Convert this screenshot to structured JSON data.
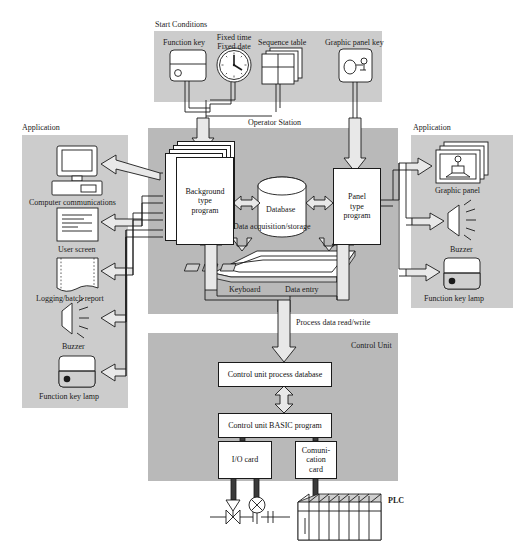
{
  "diagram": {
    "colors": {
      "panel_gray": "#b9b9b9",
      "panel_light_gray": "#cccccc",
      "panel_dark_gray": "#a8a8a8",
      "box_fill": "#ffffff",
      "arrow_fill": "#e8e8e8",
      "line": "#1a1a1a"
    }
  },
  "start_conditions": {
    "panel_label": "Start Conditions",
    "items": [
      {
        "label": "Function key",
        "icon": "function-key-icon"
      },
      {
        "label": "Fixed time\nFixed date",
        "line1": "Fixed time",
        "line2": "Fixed date",
        "icon": "clock-icon"
      },
      {
        "label": "Sequence table",
        "icon": "sequence-table-icon"
      },
      {
        "label": "Graphic panel key",
        "icon": "graphic-panel-key-icon"
      }
    ]
  },
  "operator_station": {
    "panel_label": "Operator Station",
    "blocks": [
      {
        "id": "background-type-program",
        "label": "Background\ntype\nprogram",
        "l1": "Background",
        "l2": "type",
        "l3": "program"
      },
      {
        "id": "database",
        "label": "Database"
      },
      {
        "id": "panel-type-program",
        "label": "Panel\ntype\nprogram",
        "l1": "Panel",
        "l2": "type",
        "l3": "program"
      }
    ],
    "captions": [
      {
        "id": "data-acquisition-storage",
        "label": "Data acquisition/storage"
      },
      {
        "id": "keyboard",
        "label": "Keyboard"
      },
      {
        "id": "data-entry",
        "label": "Data entry"
      }
    ]
  },
  "link_label": {
    "process_data": "Process data read/write"
  },
  "control_unit": {
    "panel_label": "Control Unit",
    "blocks": [
      {
        "id": "control-unit-process-database",
        "label": "Control unit process database"
      },
      {
        "id": "control-unit-basic-program",
        "label": "Control unit BASIC program"
      },
      {
        "id": "io-card",
        "label": "I/O card"
      },
      {
        "id": "communication-card",
        "label": "Comuni-\ncation\ncard",
        "l1": "Comuni-",
        "l2": "cation",
        "l3": "card"
      }
    ],
    "field": [
      {
        "id": "plc",
        "label": "PLC"
      },
      {
        "id": "control-valve",
        "label": ""
      },
      {
        "id": "instrument",
        "label": ""
      }
    ]
  },
  "application_left": {
    "panel_label": "Application",
    "items": [
      {
        "label": "Computer communications",
        "icon": "computer-icon"
      },
      {
        "label": "User screen",
        "icon": "document-screen-icon"
      },
      {
        "label": "Logging/batch report",
        "icon": "printout-icon"
      },
      {
        "label": "Buzzer",
        "icon": "buzzer-icon"
      },
      {
        "label": "Function key lamp",
        "icon": "function-key-lamp-icon"
      }
    ]
  },
  "application_right": {
    "panel_label": "Application",
    "items": [
      {
        "label": "Graphic panel",
        "icon": "graphic-panel-icon"
      },
      {
        "label": "Buzzer",
        "icon": "buzzer-icon"
      },
      {
        "label": "Function key lamp",
        "icon": "function-key-lamp-icon"
      }
    ]
  }
}
